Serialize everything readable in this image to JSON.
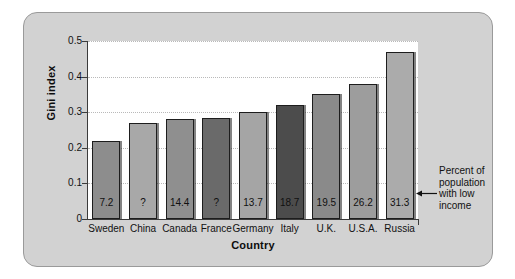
{
  "chart_data": {
    "type": "bar",
    "title": "",
    "xlabel": "Country",
    "ylabel": "Gini index",
    "ylim": [
      0,
      0.5
    ],
    "yticks": [
      "0",
      "0.1",
      "0.2",
      "0.3",
      "0.4",
      "0.5"
    ],
    "grid": true,
    "legend": false,
    "categories": [
      "Sweden",
      "China",
      "Canada",
      "France",
      "Germany",
      "Italy",
      "U.K.",
      "U.S.A.",
      "Russia"
    ],
    "values": [
      0.22,
      0.27,
      0.28,
      0.285,
      0.3,
      0.32,
      0.35,
      0.38,
      0.47
    ],
    "bar_labels": [
      "7.2",
      "?",
      "14.4",
      "?",
      "13.7",
      "18.7",
      "19.5",
      "26.2",
      "31.3"
    ],
    "bar_colors": [
      "#8d8d8d",
      "#a8a8a8",
      "#8f8f8f",
      "#6a6a6a",
      "#a5a5a5",
      "#4c4c4c",
      "#8a8a8a",
      "#9d9d9d",
      "#ababab"
    ],
    "annotation": {
      "lines": [
        "Percent of",
        "population",
        "with low",
        "income"
      ],
      "arrow": "left-arrow"
    }
  },
  "style": {
    "frame_fill": "#d2d2d2",
    "frame_border": "#9a9a9a",
    "plot_fill": "#ffffff",
    "axis_color": "#3b3b3b",
    "grid_color": "#b9b9b9"
  }
}
